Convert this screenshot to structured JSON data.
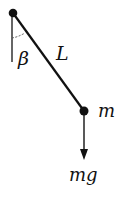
{
  "diagram": {
    "labels": {
      "angle": "β",
      "length": "L",
      "mass": "m",
      "weight": "mg"
    },
    "geometry": {
      "pivot": {
        "x": 13,
        "y": 13,
        "r": 4
      },
      "bob": {
        "x": 84,
        "y": 111,
        "r": 4
      },
      "vertical_reference": {
        "x": 12,
        "y1": 13,
        "y2": 62
      },
      "force_arrow": {
        "x": 84,
        "y1": 111,
        "y2": 159
      }
    },
    "colors": {
      "stroke": "#111111",
      "background": "#ffffff"
    }
  }
}
